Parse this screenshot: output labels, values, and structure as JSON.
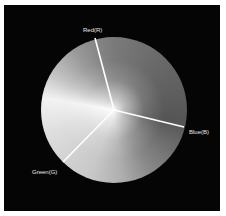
{
  "diagram": {
    "type": "color-wheel",
    "center": [
      114,
      110
    ],
    "radius": 73,
    "segments": [
      {
        "label": "Red(R)",
        "end_point": [
          95,
          38
        ],
        "label_position": [
          83,
          27
        ]
      },
      {
        "label": "Blue(B)",
        "end_point": [
          184,
          127
        ],
        "label_position": [
          189,
          129
        ]
      },
      {
        "label": "Green(G)",
        "end_point": [
          63,
          162
        ],
        "label_position": [
          32,
          169
        ]
      }
    ],
    "colors": {
      "frame": "#ffffff",
      "background": "#050505",
      "divider": "#ffffff",
      "label": "#e8e8e8"
    }
  }
}
